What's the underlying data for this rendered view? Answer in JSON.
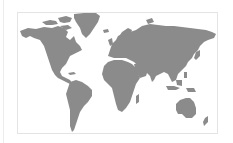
{
  "map": {
    "title": "World map",
    "style": "gray silhouette",
    "colors": {
      "land": "#8b8b8b",
      "water": "#ffffff",
      "frame": "#e4e4e4"
    },
    "regions": [
      {
        "id": "north-america",
        "label": "North America"
      },
      {
        "id": "greenland",
        "label": "Greenland"
      },
      {
        "id": "south-america",
        "label": "South America"
      },
      {
        "id": "europe",
        "label": "Europe"
      },
      {
        "id": "asia",
        "label": "Asia"
      },
      {
        "id": "africa",
        "label": "Africa"
      },
      {
        "id": "australia",
        "label": "Australia"
      }
    ]
  }
}
